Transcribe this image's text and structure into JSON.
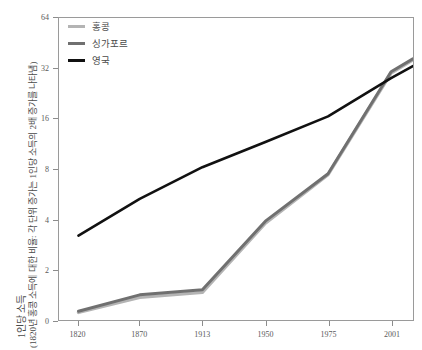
{
  "chart_data": {
    "type": "line",
    "title": "",
    "xlabel": "",
    "ylabel": "1인당 소득",
    "ylabel_sub": "(1820년 홍콩 소득에 대한 비율: 각 단위 증가는 1인당 소득의 2배 증가를 나타냄)",
    "x_tick_labels": [
      "1820",
      "1870",
      "1913",
      "1950",
      "1975",
      "2001"
    ],
    "x_tick_values": [
      1820,
      1870,
      1913,
      1950,
      1975,
      2001
    ],
    "y_tick_labels": [
      "0",
      "2",
      "4",
      "8",
      "16",
      "32",
      "64"
    ],
    "y_tick_values": [
      0,
      2,
      4,
      8,
      16,
      32,
      64
    ],
    "y_scale": "log2-like-ordinal",
    "ylim": [
      0,
      64
    ],
    "xlim": [
      1805,
      2012
    ],
    "grid": false,
    "legend_position": "top-left",
    "series": [
      {
        "name": "홍콩",
        "color": "#b4b4b4",
        "x": [
          1820,
          1870,
          1913,
          1950,
          1975,
          2001,
          2010
        ],
        "values": [
          0.3,
          0.9,
          1.1,
          3.8,
          7.4,
          30.0,
          36.0
        ]
      },
      {
        "name": "싱가포르",
        "color": "#707070",
        "x": [
          1820,
          1870,
          1913,
          1950,
          1975,
          2001,
          2010
        ],
        "values": [
          0.35,
          1.0,
          1.2,
          3.9,
          7.5,
          30.5,
          36.5
        ]
      },
      {
        "name": "영국",
        "color": "#111111",
        "x": [
          1820,
          1870,
          1913,
          1950,
          1975,
          2001,
          2010
        ],
        "values": [
          3.2,
          5.3,
          8.2,
          11.6,
          16.5,
          28.0,
          33.0
        ]
      }
    ]
  },
  "legend": {
    "items": [
      {
        "label": "홍콩",
        "color": "#b4b4b4"
      },
      {
        "label": "싱가포르",
        "color": "#707070"
      },
      {
        "label": "영국",
        "color": "#111111"
      }
    ]
  },
  "axis": {
    "y_title_main": "1인당 소득",
    "y_title_sub": "(1820년 홍콩 소득에 대한 비율: 각 단위 증가는 1인당 소득의 2배 증가를 나타냄)"
  },
  "colors": {
    "hong_kong": "#b4b4b4",
    "singapore": "#707070",
    "uk": "#111111",
    "axis": "#9a9a9a",
    "tick_text": "#5a5a5a"
  }
}
